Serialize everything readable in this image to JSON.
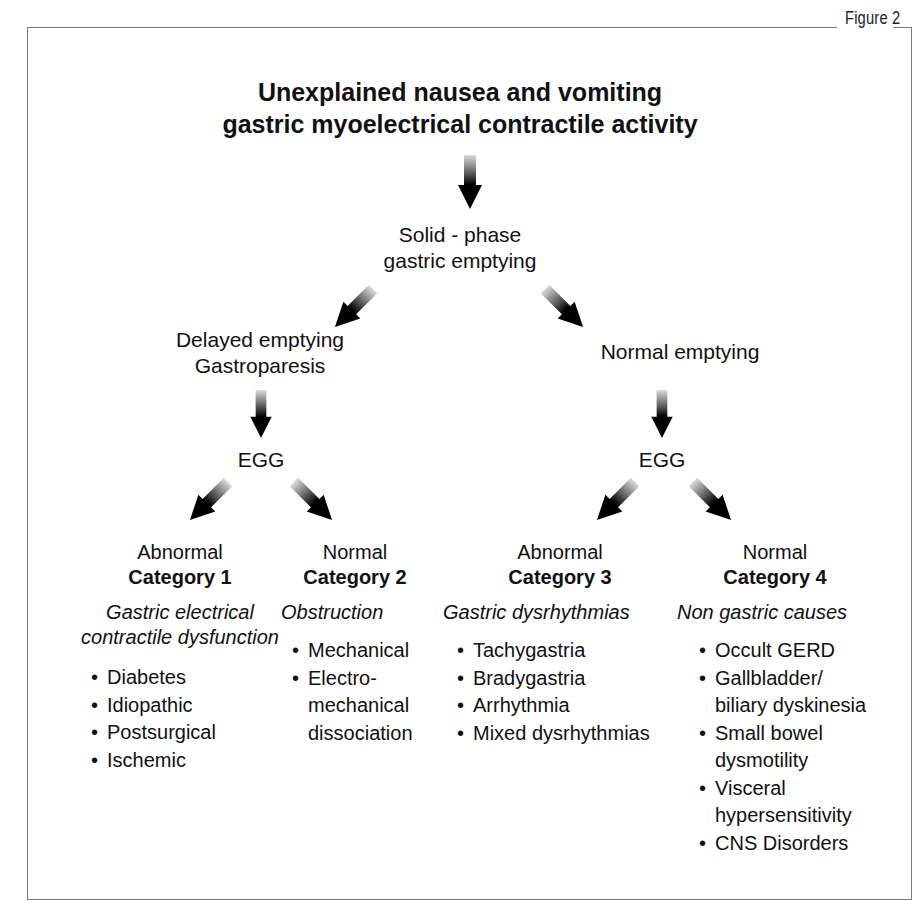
{
  "figure_label": "Figure 2",
  "title": {
    "line1": "Unexplained nausea and vomiting",
    "line2": "gastric myoelectrical contractile activity"
  },
  "nodes": {
    "solid_phase": {
      "line1": "Solid - phase",
      "line2": "gastric emptying"
    },
    "delayed": {
      "line1": "Delayed emptying",
      "line2": "Gastroparesis"
    },
    "normal_emptying": {
      "label": "Normal emptying"
    },
    "egg_left": {
      "label": "EGG"
    },
    "egg_right": {
      "label": "EGG"
    }
  },
  "categories": [
    {
      "result": "Abnormal",
      "category": "Category 1",
      "description_line1": "Gastric electrical",
      "description_line2": "contractile dysfunction",
      "items": [
        {
          "text": "Diabetes"
        },
        {
          "text": "Idiopathic"
        },
        {
          "text": "Postsurgical"
        },
        {
          "text": "Ischemic"
        }
      ]
    },
    {
      "result": "Normal",
      "category": "Category 2",
      "description_line1": "Obstruction",
      "items": [
        {
          "text": "Mechanical"
        },
        {
          "text": "Electro-",
          "cont1": "mechanical",
          "cont2": "dissociation"
        }
      ]
    },
    {
      "result": "Abnormal",
      "category": "Category 3",
      "description_line1": "Gastric dysrhythmias",
      "items": [
        {
          "text": "Tachygastria"
        },
        {
          "text": "Bradygastria"
        },
        {
          "text": "Arrhythmia"
        },
        {
          "text": "Mixed dysrhythmias"
        }
      ]
    },
    {
      "result": "Normal",
      "category": "Category 4",
      "description_line1": "Non gastric causes",
      "items": [
        {
          "text": "Occult GERD"
        },
        {
          "text": "Gallbladder/",
          "cont1": "biliary dyskinesia"
        },
        {
          "text": "Small bowel",
          "cont1": "dysmotility"
        },
        {
          "text": "Visceral",
          "cont1": "hypersensitivity"
        },
        {
          "text": "CNS Disorders"
        }
      ]
    }
  ],
  "bullet_glyph": "•",
  "colors": {
    "text": "#111111",
    "frame": "#7a7a7a",
    "arrow_dark": "#000000",
    "arrow_light": "#d8d8d8"
  }
}
